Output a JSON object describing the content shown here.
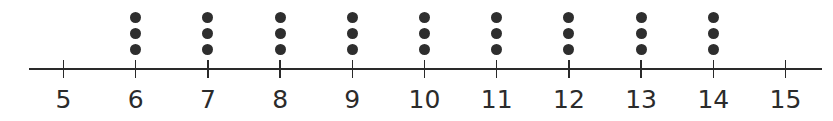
{
  "chart_data": {
    "type": "dot_plot",
    "title": "",
    "xlabel": "",
    "ylabel": "",
    "xlim": [
      5,
      15
    ],
    "ticks": [
      5,
      6,
      7,
      8,
      9,
      10,
      11,
      12,
      13,
      14,
      15
    ],
    "tick_labels": [
      "5",
      "6",
      "7",
      "8",
      "9",
      "10",
      "11",
      "12",
      "13",
      "14",
      "15"
    ],
    "categories": [
      5,
      6,
      7,
      8,
      9,
      10,
      11,
      12,
      13,
      14,
      15
    ],
    "values": [
      0,
      3,
      3,
      3,
      3,
      3,
      3,
      3,
      3,
      3,
      0
    ],
    "grid": false,
    "legend": null
  },
  "colors": {
    "dot": "#2e2e2e",
    "axis": "#2a2a2a",
    "label": "#2b2b2b"
  }
}
